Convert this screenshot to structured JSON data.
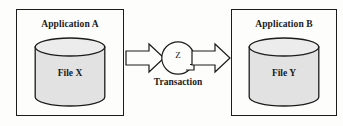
{
  "diagram": {
    "type": "transaction-between-applications",
    "background_color": "#fdfdfb",
    "stroke_color": "#1c1c1c",
    "cylinder_fill": "#e0e0e0",
    "left_box": {
      "title": "Application A",
      "cylinder_label": "File X",
      "cylinder_icon": "database-cylinder-icon"
    },
    "right_box": {
      "title": "Application B",
      "cylinder_label": "File Y",
      "cylinder_icon": "database-cylinder-icon"
    },
    "center": {
      "node_label": "Z",
      "caption": "Transaction",
      "left_arrow_icon": "block-arrow-right-icon",
      "right_arrow_icon": "block-arrow-right-icon",
      "node_icon": "circle-node-icon"
    }
  }
}
